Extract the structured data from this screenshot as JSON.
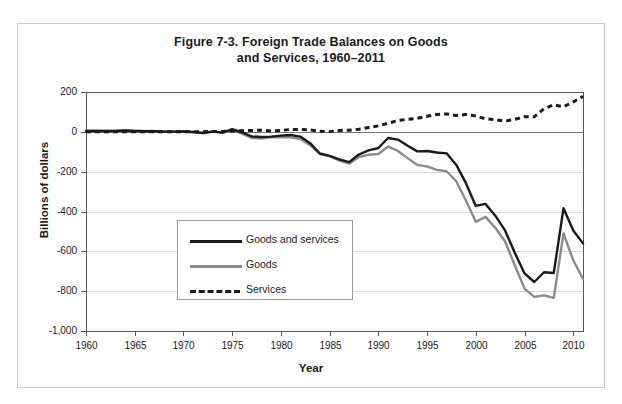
{
  "figure": {
    "title_line1": "Figure 7-3. Foreign Trade Balances on Goods",
    "title_line2": "and Services, 1960–2011"
  },
  "axes": {
    "ylabel": "Billions of dollars",
    "xlabel": "Year",
    "yticks": [
      "200",
      "0",
      "-200",
      "-400",
      "-600",
      "-800",
      "-1,000"
    ],
    "xticks": [
      "1960",
      "1965",
      "1970",
      "1975",
      "1980",
      "1985",
      "1990",
      "1995",
      "2000",
      "2005",
      "2010"
    ]
  },
  "legend": {
    "items": [
      {
        "label": "Goods and services",
        "style": "solid-black"
      },
      {
        "label": "Goods",
        "style": "solid-gray"
      },
      {
        "label": "Services",
        "style": "dashed-black"
      }
    ]
  },
  "colors": {
    "goods_and_services": "#1a1a1a",
    "goods": "#8c8c8c",
    "services": "#1a1a1a",
    "grid": "#d8d8d8",
    "axis": "#555555",
    "frame": "#c9c9c9"
  },
  "chart_data": {
    "type": "line",
    "title": "Figure 7-3. Foreign Trade Balances on Goods and Services, 1960–2011",
    "xlabel": "Year",
    "ylabel": "Billions of dollars",
    "xlim": [
      1960,
      2011
    ],
    "ylim": [
      -1000,
      200
    ],
    "ytick_interval": 200,
    "xtick_interval": 5,
    "grid": true,
    "legend_position": "center-left-inside",
    "x": [
      1960,
      1961,
      1962,
      1963,
      1964,
      1965,
      1966,
      1967,
      1968,
      1969,
      1970,
      1971,
      1972,
      1973,
      1974,
      1975,
      1976,
      1977,
      1978,
      1979,
      1980,
      1981,
      1982,
      1983,
      1984,
      1985,
      1986,
      1987,
      1988,
      1989,
      1990,
      1991,
      1992,
      1993,
      1994,
      1995,
      1996,
      1997,
      1998,
      1999,
      2000,
      2001,
      2002,
      2003,
      2004,
      2005,
      2006,
      2007,
      2008,
      2009,
      2010,
      2011
    ],
    "series": [
      {
        "name": "Goods and services",
        "style": "solid",
        "color": "#1a1a1a",
        "values": [
          4,
          5,
          4,
          5,
          7,
          5,
          3,
          3,
          1,
          1,
          2,
          -1,
          -6,
          1,
          -4,
          13,
          -2,
          -23,
          -26,
          -24,
          -19,
          -16,
          -24,
          -57,
          -109,
          -121,
          -138,
          -152,
          -114,
          -93,
          -81,
          -31,
          -39,
          -70,
          -98,
          -96,
          -104,
          -108,
          -166,
          -259,
          -372,
          -362,
          -421,
          -495,
          -607,
          -711,
          -754,
          -705,
          -709,
          -384,
          -495,
          -560
        ]
      },
      {
        "name": "Goods",
        "style": "solid",
        "color": "#8c8c8c",
        "values": [
          5,
          6,
          4,
          5,
          7,
          5,
          4,
          4,
          1,
          1,
          3,
          -2,
          -6,
          1,
          -5,
          9,
          -9,
          -31,
          -34,
          -28,
          -26,
          -28,
          -36,
          -67,
          -112,
          -122,
          -145,
          -160,
          -127,
          -115,
          -111,
          -74,
          -96,
          -132,
          -166,
          -174,
          -191,
          -198,
          -248,
          -346,
          -452,
          -427,
          -482,
          -549,
          -670,
          -787,
          -829,
          -821,
          -834,
          -510,
          -645,
          -738
        ]
      },
      {
        "name": "Services",
        "style": "dashed",
        "color": "#1a1a1a",
        "values": [
          0,
          1,
          1,
          1,
          1,
          1,
          1,
          1,
          1,
          1,
          1,
          1,
          1,
          2,
          2,
          4,
          6,
          7,
          8,
          4,
          7,
          12,
          12,
          10,
          3,
          1,
          7,
          8,
          13,
          22,
          30,
          43,
          57,
          62,
          68,
          78,
          87,
          90,
          82,
          87,
          80,
          65,
          61,
          54,
          63,
          76,
          75,
          116,
          136,
          126,
          150,
          178
        ]
      }
    ]
  }
}
